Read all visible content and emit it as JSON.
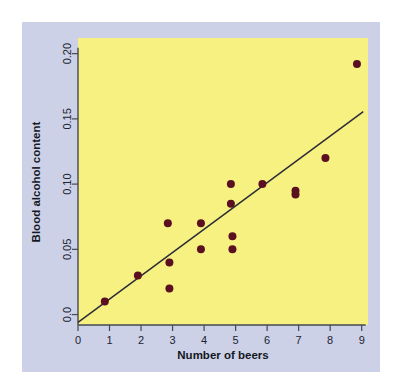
{
  "figure": {
    "panel_background": "#ccd1e8",
    "page_background": "#ffffff"
  },
  "chart_data": {
    "type": "scatter",
    "title": "",
    "xlabel": "Number of beers",
    "ylabel": "Blood alcohol content",
    "xlim": [
      0,
      9.2
    ],
    "ylim": [
      -0.008,
      0.212
    ],
    "xticks": [
      0,
      1,
      2,
      3,
      4,
      5,
      6,
      7,
      8,
      9
    ],
    "xtick_labels": [
      "0",
      "1",
      "2",
      "3",
      "4",
      "5",
      "6",
      "7",
      "8",
      "9"
    ],
    "yticks": [
      0.0,
      0.05,
      0.1,
      0.15,
      0.2
    ],
    "ytick_labels": [
      "0.0",
      "0.05",
      "0.10",
      "0.15",
      "0.20"
    ],
    "grid": false,
    "legend": false,
    "plot_background": "#f7f181",
    "point_color": "#5a1020",
    "point_size": 4,
    "points": [
      {
        "x": 0.85,
        "y": 0.01
      },
      {
        "x": 1.9,
        "y": 0.03
      },
      {
        "x": 2.9,
        "y": 0.04
      },
      {
        "x": 2.9,
        "y": 0.02
      },
      {
        "x": 2.85,
        "y": 0.07
      },
      {
        "x": 3.9,
        "y": 0.07
      },
      {
        "x": 3.9,
        "y": 0.05
      },
      {
        "x": 4.85,
        "y": 0.1
      },
      {
        "x": 4.85,
        "y": 0.085
      },
      {
        "x": 4.9,
        "y": 0.06
      },
      {
        "x": 4.9,
        "y": 0.05
      },
      {
        "x": 5.85,
        "y": 0.1
      },
      {
        "x": 6.9,
        "y": 0.095
      },
      {
        "x": 6.9,
        "y": 0.092
      },
      {
        "x": 7.85,
        "y": 0.12
      },
      {
        "x": 8.85,
        "y": 0.192
      }
    ],
    "fit_line": {
      "type": "least-squares-regression",
      "color": "#2c2c38",
      "x_start": 0.0,
      "y_start": -0.006,
      "x_end": 9.05,
      "y_end": 0.1555
    }
  }
}
